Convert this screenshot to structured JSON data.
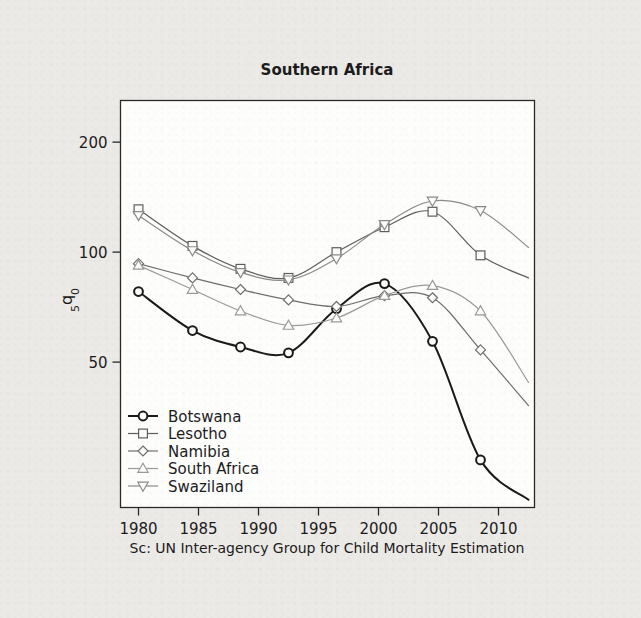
{
  "chart_data": {
    "type": "line",
    "title": "Southern Africa",
    "xlabel": "",
    "ylabel": "5q0",
    "ylabel_parts": {
      "sub_left": "5",
      "main": "q",
      "sub_right": "0"
    },
    "source_note": "Sc: UN Inter-agency Group for Child Mortality Estimation",
    "xlim": [
      1978.5,
      2013.0
    ],
    "ylim": [
      20,
      260
    ],
    "yscale": "log",
    "grid": false,
    "legend_position": "lower-left-inside",
    "xticks": [
      1980,
      1985,
      1990,
      1995,
      2000,
      2005,
      2010
    ],
    "xticklabels": [
      "1980",
      "1985",
      "1990",
      "1995",
      "2000",
      "2005",
      "2010"
    ],
    "yticks": [
      50,
      100,
      200
    ],
    "yticklabels": [
      "50",
      "100",
      "200"
    ],
    "series": [
      {
        "name": "Botswana",
        "marker": "circle",
        "color": "#1a1a1a",
        "linewidth": 2.0,
        "x": [
          1980,
          1984.5,
          1988.5,
          1992.5,
          1996.5,
          2000.5,
          2004.5,
          2008.5
        ],
        "y": [
          78,
          61,
          55,
          53,
          70,
          82,
          57,
          27
        ],
        "x_end": 2012.5,
        "y_end": 21
      },
      {
        "name": "Lesotho",
        "marker": "square",
        "color": "#5e5e5e",
        "linewidth": 1.2,
        "x": [
          1980,
          1984.5,
          1988.5,
          1992.5,
          1996.5,
          2000.5,
          2004.5,
          2008.5
        ],
        "y": [
          131,
          104,
          90,
          85,
          100,
          117,
          129,
          98
        ],
        "x_end": 2012.5,
        "y_end": 85
      },
      {
        "name": "Namibia",
        "marker": "diamond",
        "color": "#6e6e6e",
        "linewidth": 1.2,
        "x": [
          1980,
          1984.5,
          1988.5,
          1992.5,
          1996.5,
          2000.5,
          2004.5,
          2008.5
        ],
        "y": [
          93,
          85,
          79,
          74,
          71,
          76,
          75,
          54
        ],
        "x_end": 2012.5,
        "y_end": 38
      },
      {
        "name": "South Africa",
        "marker": "triangle-up",
        "color": "#9a9a9a",
        "linewidth": 1.2,
        "x": [
          1980,
          1984.5,
          1988.5,
          1992.5,
          1996.5,
          2000.5,
          2004.5,
          2008.5
        ],
        "y": [
          92,
          79,
          69,
          63,
          66,
          76,
          81,
          69
        ],
        "x_end": 2012.5,
        "y_end": 44
      },
      {
        "name": "Swaziland",
        "marker": "triangle-down",
        "color": "#8a8a8a",
        "linewidth": 1.2,
        "x": [
          1980,
          1984.5,
          1988.5,
          1992.5,
          1996.5,
          2000.5,
          2004.5,
          2008.5
        ],
        "y": [
          126,
          101,
          88,
          84,
          96,
          119,
          138,
          130
        ],
        "x_end": 2012.5,
        "y_end": 103
      }
    ],
    "legend_entries": [
      {
        "label": "Botswana",
        "marker": "circle",
        "color": "#1a1a1a"
      },
      {
        "label": "Lesotho",
        "marker": "square",
        "color": "#5e5e5e"
      },
      {
        "label": "Namibia",
        "marker": "diamond",
        "color": "#6e6e6e"
      },
      {
        "label": "South Africa",
        "marker": "triangle-up",
        "color": "#9a9a9a"
      },
      {
        "label": "Swaziland",
        "marker": "triangle-down",
        "color": "#8a8a8a"
      }
    ]
  }
}
